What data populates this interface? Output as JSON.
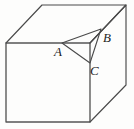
{
  "figure": {
    "kind": "geometry-diagram",
    "width": 134,
    "height": 129,
    "background_color": "#fdfdfc",
    "line_color": "#4a4a4a",
    "label_color": "#1c1c1c"
  },
  "labels": {
    "a": "A",
    "b": "B",
    "c": "C"
  },
  "points": {
    "A": {
      "x": 62,
      "y": 43
    },
    "B": {
      "x": 101,
      "y": 29
    },
    "C": {
      "x": 90,
      "y": 63
    },
    "front_top_left": {
      "x": 6,
      "y": 43
    },
    "front_top_right": {
      "x": 90,
      "y": 43
    },
    "front_bottom_left": {
      "x": 6,
      "y": 122
    },
    "front_bottom_right": {
      "x": 90,
      "y": 122
    },
    "back_top_left": {
      "x": 42,
      "y": 5
    },
    "back_top_right": {
      "x": 126,
      "y": 5
    },
    "back_bottom_right": {
      "x": 126,
      "y": 85
    }
  },
  "paths": {
    "front_face": "M6,43 L90,43 L90,122 L6,122 Z",
    "top_face": "M6,43 L42,5 L126,5 L90,43",
    "right_face": "M90,43 L126,5 L126,85 L90,122",
    "triangle": "M62,43 L101,29 L90,63 Z"
  }
}
